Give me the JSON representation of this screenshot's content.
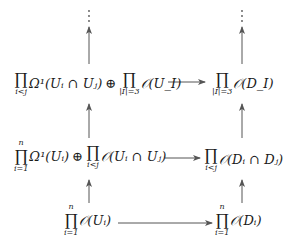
{
  "diagram": {
    "type": "commutative-diagram",
    "rows": [
      {
        "left": {
          "terms": [
            {
              "product": "∏",
              "sub": "i<j",
              "sup": "",
              "expr": "Ω¹(Uᵢ ∩ Uⱼ)"
            },
            {
              "op": "⊕"
            },
            {
              "product": "∏",
              "sub": "|I|=3",
              "sup": "",
              "expr": "𝒪(U_I)"
            }
          ],
          "latex": "\\prod_{i<j}\\Omega^1(U_i\\cap U_j)\\oplus\\prod_{|I|=3}\\mathcal{O}(U_I)"
        },
        "right": {
          "terms": [
            {
              "product": "∏",
              "sub": "|I|=3",
              "sup": "",
              "expr": "𝒪(D_I)"
            }
          ],
          "latex": "\\prod_{|I|=3}\\mathcal{O}(D_I)"
        }
      },
      {
        "left": {
          "terms": [
            {
              "product": "∏",
              "sub": "i=1",
              "sup": "n",
              "expr": "Ω¹(Uᵢ)"
            },
            {
              "op": "⊕"
            },
            {
              "product": "∏",
              "sub": "i<j",
              "sup": "",
              "expr": "𝒪(Uᵢ ∩ Uⱼ)"
            }
          ],
          "latex": "\\prod_{i=1}^n\\Omega^1(U_i)\\oplus\\prod_{i<j}\\mathcal{O}(U_i\\cap U_j)"
        },
        "right": {
          "terms": [
            {
              "product": "∏",
              "sub": "i<j",
              "sup": "",
              "expr": "𝒪(Dᵢ ∩ Dⱼ)"
            }
          ],
          "latex": "\\prod_{i<j}\\mathcal{O}(D_i\\cap D_j)"
        }
      },
      {
        "left": {
          "terms": [
            {
              "product": "∏",
              "sub": "i=1",
              "sup": "n",
              "expr": "𝒪(Uᵢ)"
            }
          ],
          "latex": "\\prod_{i=1}^n\\mathcal{O}(U_i)"
        },
        "right": {
          "terms": [
            {
              "product": "∏",
              "sub": "i=1",
              "sup": "n",
              "expr": "𝒪(Dᵢ)"
            }
          ],
          "latex": "\\prod_{i=1}^n\\mathcal{O}(D_i)"
        }
      }
    ],
    "continuation": "⋮",
    "arrows": {
      "horizontal": "left-to-right in every row",
      "vertical": "bottom-to-top in both columns"
    },
    "colors": {
      "ink": "#1a1a1a",
      "arrow": "#555555",
      "background": "#ffffff"
    }
  }
}
